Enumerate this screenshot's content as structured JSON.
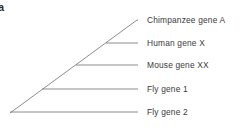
{
  "figure": {
    "panel_label": "a",
    "background_color": "#ffffff",
    "line_color": "#808080",
    "text_color": "#3a3a3a",
    "width": 240,
    "height": 137
  },
  "chart_data": {
    "type": "diagram",
    "diagram_type": "cladogram",
    "title": "",
    "root": {
      "x": 10,
      "y": 113
    },
    "backbone_end": {
      "x": 137,
      "y": 20
    },
    "tip_x": 138,
    "label_x": 147,
    "tips": [
      {
        "id": "tip-chimpanzee-gene-a",
        "label": "Chimpanzee gene A",
        "order": 1,
        "branch_y": 20,
        "node_x": 137,
        "label_y": 16
      },
      {
        "id": "tip-human-gene-x",
        "label": "Human gene X",
        "order": 2,
        "branch_y": 43,
        "node_x": 106,
        "label_y": 39
      },
      {
        "id": "tip-mouse-gene-xx",
        "label": "Mouse gene XX",
        "order": 3,
        "branch_y": 65,
        "node_x": 76,
        "label_y": 61
      },
      {
        "id": "tip-fly-gene-1",
        "label": "Fly gene 1",
        "order": 4,
        "branch_y": 89,
        "node_x": 42,
        "label_y": 85
      },
      {
        "id": "tip-fly-gene-2",
        "label": "Fly gene 2",
        "order": 5,
        "branch_y": 112,
        "node_x": 10,
        "label_y": 108
      }
    ],
    "nodes": [
      {
        "id": "node-root",
        "x": 10,
        "y": 113,
        "splits": "tip-fly-gene-2"
      },
      {
        "id": "node-1",
        "x": 42,
        "y": 89,
        "splits": "tip-fly-gene-1"
      },
      {
        "id": "node-2",
        "x": 76,
        "y": 65,
        "splits": "tip-mouse-gene-xx"
      },
      {
        "id": "node-3",
        "x": 106,
        "y": 43,
        "splits": "tip-human-gene-x"
      },
      {
        "id": "node-4",
        "x": 137,
        "y": 20,
        "splits": "tip-chimpanzee-gene-a"
      }
    ]
  }
}
